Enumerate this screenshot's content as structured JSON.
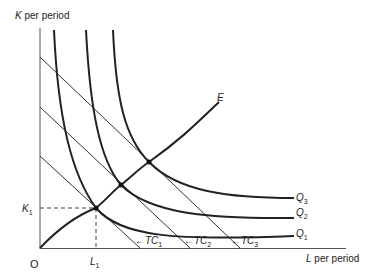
{
  "diagram": {
    "y_axis_label": {
      "var": "K",
      "rest": " per period"
    },
    "x_axis_label": {
      "var": "L",
      "rest": " per period"
    },
    "origin_label": "O",
    "k1_label": {
      "var": "K",
      "sub": "1"
    },
    "l1_label": {
      "var": "L",
      "sub": "1"
    },
    "expansion_path_label": "E",
    "isoquants": [
      {
        "var": "Q",
        "sub": "1"
      },
      {
        "var": "Q",
        "sub": "2"
      },
      {
        "var": "Q",
        "sub": "3"
      }
    ],
    "isocost_lines": [
      {
        "arrow": "←",
        "var": "TC",
        "sub": "1"
      },
      {
        "arrow": "←",
        "var": "TC",
        "sub": "2"
      },
      {
        "arrow": "←",
        "var": "TC",
        "sub": "3"
      }
    ],
    "colors": {
      "ink": "#222222",
      "thin": "#333333"
    }
  }
}
